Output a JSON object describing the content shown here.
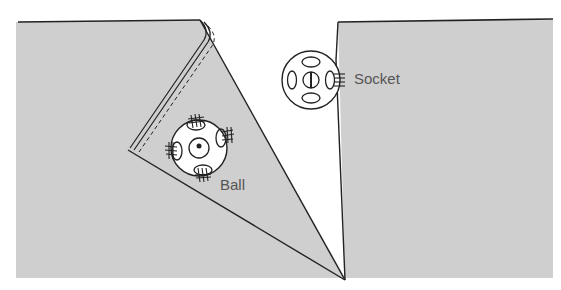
{
  "diagram": {
    "labels": {
      "ball": "Ball",
      "socket": "Socket"
    },
    "colors": {
      "fabric": "#cfcfcf",
      "line": "#222222",
      "snap_fill": "#ffffff",
      "background": "#ffffff",
      "label_text": "#555555"
    }
  }
}
